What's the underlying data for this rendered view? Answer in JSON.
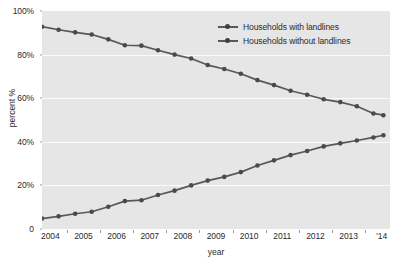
{
  "chart_data": {
    "type": "line",
    "title": "",
    "xlabel": "year",
    "ylabel": "percent %",
    "xlim": [
      2003.75,
      2014.25
    ],
    "ylim": [
      0,
      100
    ],
    "grid": true,
    "gridlines_y": [
      20,
      40,
      60,
      80
    ],
    "legend_position": "top-right",
    "y_ticks": [
      "0",
      "20%",
      "40%",
      "60%",
      "80%",
      "100%"
    ],
    "y_tick_values": [
      0,
      20,
      40,
      60,
      80,
      100
    ],
    "x_ticks": [
      "2004",
      "2005",
      "2006",
      "2007",
      "2008",
      "2009",
      "2010",
      "2011",
      "2012",
      "2013",
      "'14"
    ],
    "x_tick_values": [
      2004,
      2005,
      2006,
      2007,
      2008,
      2009,
      2010,
      2011,
      2012,
      2013,
      2014
    ],
    "x": [
      2003.75,
      2004.25,
      2004.75,
      2005.25,
      2005.75,
      2006.25,
      2006.75,
      2007.25,
      2007.75,
      2008.25,
      2008.75,
      2009.25,
      2009.75,
      2010.25,
      2010.75,
      2011.25,
      2011.75,
      2012.25,
      2012.75,
      2013.25,
      2013.75,
      2014.05
    ],
    "series": [
      {
        "name": "Households with landlines",
        "color": "#585858",
        "values": [
          92.8,
          91.4,
          90.2,
          89.2,
          87.0,
          84.3,
          84.1,
          82.0,
          80.0,
          78.2,
          75.2,
          73.4,
          71.2,
          68.3,
          66.0,
          63.4,
          61.6,
          59.5,
          58.2,
          56.3,
          53.0,
          52.2
        ]
      },
      {
        "name": "Households without landlines",
        "color": "#585858",
        "values": [
          4.8,
          5.8,
          7.0,
          7.9,
          10.2,
          12.8,
          13.2,
          15.6,
          17.6,
          20.0,
          22.2,
          23.9,
          26.1,
          29.1,
          31.5,
          33.9,
          35.8,
          37.9,
          39.3,
          40.6,
          42.0,
          43.0
        ]
      }
    ]
  },
  "legend": {
    "items": [
      {
        "label": "Households with landlines"
      },
      {
        "label": "Households without landlines"
      }
    ]
  },
  "axes": {
    "y_title": "percent %",
    "x_title": "year"
  }
}
